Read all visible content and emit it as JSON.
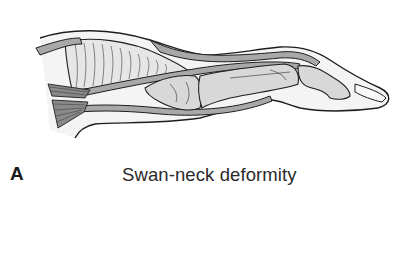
{
  "figure": {
    "panel_label": "A",
    "caption": "Swan-neck deformity",
    "colors": {
      "outline": "#1e1e1e",
      "tendon_fill": "#a8a8a8",
      "bone_fill": "#d4d4d4",
      "skin_fill": "#f2f2f2",
      "background": "#ffffff"
    }
  }
}
